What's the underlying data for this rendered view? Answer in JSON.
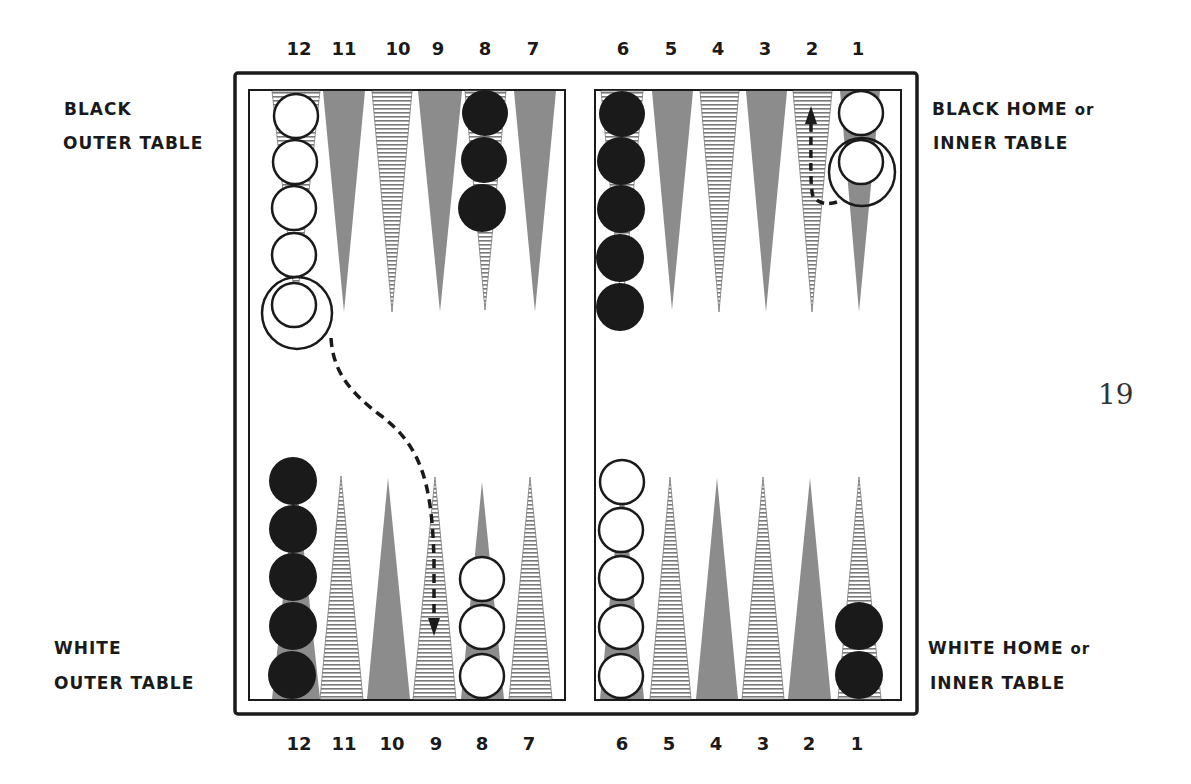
{
  "page_number": "19",
  "labels": {
    "black_outer": {
      "line1": "BLACK",
      "line2": "OUTER TABLE"
    },
    "black_home": {
      "line1": "BLACK HOME",
      "line1_suffix": "or",
      "line2": "INNER TABLE"
    },
    "white_outer": {
      "line1": "WHITE",
      "line2": "OUTER TABLE"
    },
    "white_home": {
      "line1": "WHITE HOME",
      "line1_suffix": "or",
      "line2": "INNER TABLE"
    }
  },
  "point_numbers": {
    "top": [
      "12",
      "11",
      "10",
      "9",
      "8",
      "7",
      "6",
      "5",
      "4",
      "3",
      "2",
      "1"
    ],
    "bottom": [
      "12",
      "11",
      "10",
      "9",
      "8",
      "7",
      "6",
      "5",
      "4",
      "3",
      "2",
      "1"
    ]
  },
  "colors": {
    "ink": "#1a1a1a",
    "gray_point": "#8c8c8c",
    "hatch_line": "#7a7a7a",
    "background": "#ffffff"
  },
  "board_position": {
    "top_row": [
      {
        "point": "12",
        "checkers": "white",
        "count": 5,
        "circled_last": true
      },
      {
        "point": "11",
        "checkers": "none",
        "count": 0
      },
      {
        "point": "10",
        "checkers": "none",
        "count": 0
      },
      {
        "point": "9",
        "checkers": "none",
        "count": 0
      },
      {
        "point": "8",
        "checkers": "black",
        "count": 3
      },
      {
        "point": "7",
        "checkers": "none",
        "count": 0
      },
      {
        "point": "6",
        "checkers": "black",
        "count": 5
      },
      {
        "point": "5",
        "checkers": "none",
        "count": 0
      },
      {
        "point": "4",
        "checkers": "none",
        "count": 0
      },
      {
        "point": "3",
        "checkers": "none",
        "count": 0
      },
      {
        "point": "2",
        "checkers": "none",
        "count": 0
      },
      {
        "point": "1",
        "checkers": "white",
        "count": 2,
        "circled_last": true
      }
    ],
    "bottom_row": [
      {
        "point": "12",
        "checkers": "black",
        "count": 5
      },
      {
        "point": "11",
        "checkers": "none",
        "count": 0
      },
      {
        "point": "10",
        "checkers": "none",
        "count": 0
      },
      {
        "point": "9",
        "checkers": "none",
        "count": 0
      },
      {
        "point": "8",
        "checkers": "white",
        "count": 3
      },
      {
        "point": "7",
        "checkers": "none",
        "count": 0
      },
      {
        "point": "6",
        "checkers": "white",
        "count": 5
      },
      {
        "point": "5",
        "checkers": "none",
        "count": 0
      },
      {
        "point": "4",
        "checkers": "none",
        "count": 0
      },
      {
        "point": "3",
        "checkers": "none",
        "count": 0
      },
      {
        "point": "2",
        "checkers": "none",
        "count": 0
      },
      {
        "point": "1",
        "checkers": "black",
        "count": 2
      }
    ],
    "move_arrows": [
      {
        "from": "top 12 (circled white)",
        "to": "bottom 9",
        "style": "dashed"
      },
      {
        "from": "top 1 (circled white)",
        "to": "top 2",
        "style": "dashed"
      }
    ]
  }
}
